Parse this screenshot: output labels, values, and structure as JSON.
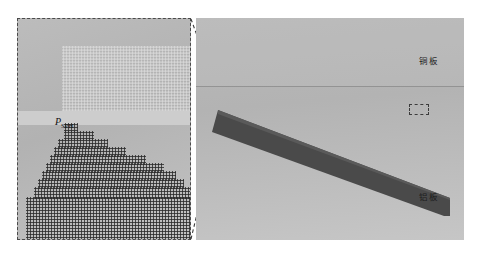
{
  "figure": {
    "type": "sph-simulation-schematic",
    "width": 480,
    "height": 257,
    "background_color": "#ffffff"
  },
  "detail_panel": {
    "name": "magnified-sph-particle-view",
    "border_style": "dashed",
    "border_color": "#4a4a4a",
    "background_color": "#b4b4b4",
    "particle_label": "P",
    "particle_label_sub": "SPH",
    "upper_block": {
      "name": "copper-sph-particles",
      "color": "#d8d8d8",
      "description": "light sparse particle lattice"
    },
    "lower_block": {
      "name": "aluminum-sph-particles",
      "color": "#2e2e2e",
      "description": "dense dark particle lattice with stepped upper edge"
    }
  },
  "scene": {
    "name": "explosive-welding-setup",
    "background_color": "#b9b9b9",
    "copper_label": "铜板",
    "aluminum_label": "铝板",
    "plate_color": "#4a4a4a",
    "gap_label": "a",
    "gap_label_sub": "SPH",
    "zoom_marker": {
      "name": "collision-point-zoom-box",
      "style": "dashed"
    }
  },
  "colors": {
    "plate_dark": "#4a4a4a",
    "panel_background": "#b4b4b4",
    "scene_background": "#b9b9b9",
    "dashed_line": "#4a4a4a",
    "particle_dark": "#2e2e2e",
    "particle_light": "#d8d8d8"
  }
}
